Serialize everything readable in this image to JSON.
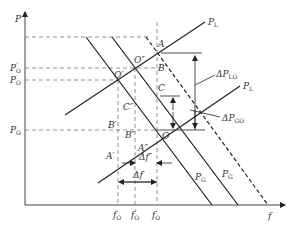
{
  "diagram": {
    "type": "power-frequency characteristic diagram",
    "axes": {
      "y_label": "P",
      "x_label": "f"
    },
    "y_ticks": [
      {
        "id": "P0dd",
        "label": "P",
        "sub": "O",
        "sup": "″"
      },
      {
        "id": "P0d",
        "label": "P",
        "sub": "O",
        "sup": "′"
      },
      {
        "id": "P0",
        "label": "P",
        "sub": "O",
        "sup": ""
      }
    ],
    "x_ticks": [
      {
        "id": "f0d",
        "label": "f",
        "sub": "O",
        "sup": "′"
      },
      {
        "id": "f0dd",
        "label": "f",
        "sub": "O",
        "sup": "″"
      },
      {
        "id": "f0",
        "label": "f",
        "sub": "O",
        "sup": ""
      }
    ],
    "curves": {
      "load_upper": {
        "label": "P",
        "sub": "L"
      },
      "load_lower": {
        "label": "P",
        "sub": "L"
      },
      "gen_left": {
        "label": "P",
        "sub": "G"
      },
      "gen_right": {
        "label": "P",
        "sub": "G"
      }
    },
    "points": {
      "O": "O",
      "O_prime": "O′",
      "O_dprime": "O″",
      "A": "A",
      "B": "B",
      "C": "C",
      "A_prime": "A′",
      "B_prime": "B′",
      "C_dprime": "C″",
      "A_dprime": "A″",
      "B_dprime": "B″"
    },
    "annotations": {
      "delta_PLO": {
        "label": "ΔP",
        "sub": "LO"
      },
      "delta_PGO": {
        "label": "ΔP",
        "sub": "GO"
      },
      "delta_f_dprime": {
        "label": "Δf″"
      },
      "delta_f_prime": {
        "label": "Δf′"
      }
    },
    "colors": {
      "line": "#222222",
      "dashed": "#555555",
      "text": "#333333"
    }
  }
}
